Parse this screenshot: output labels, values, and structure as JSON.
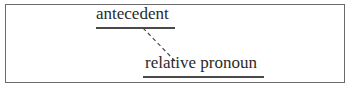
{
  "diagram": {
    "nodes": [
      {
        "id": "antecedent",
        "label": "antecedent"
      },
      {
        "id": "relative-pronoun",
        "label": "relative pronoun"
      }
    ],
    "edges": [
      {
        "from": "antecedent",
        "to": "relative-pronoun",
        "style": "dashed"
      }
    ],
    "colors": {
      "text": "#2a2a2a",
      "line": "#4a4a4a",
      "frame": "#6a6a6a"
    }
  }
}
